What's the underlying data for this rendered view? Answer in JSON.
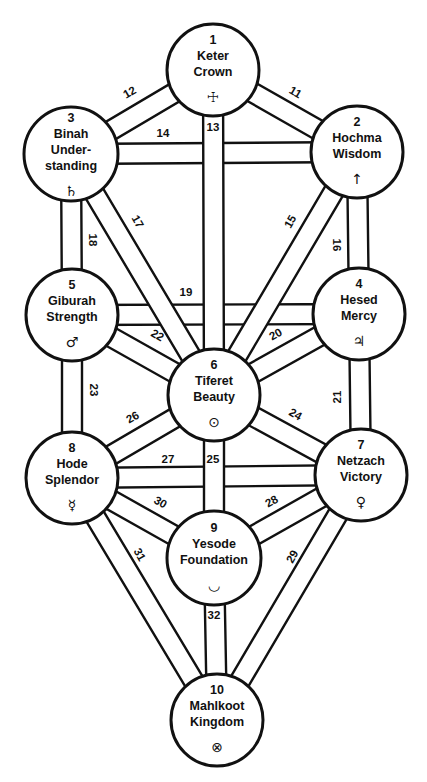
{
  "nodes": [
    {
      "id": 1,
      "num": "1",
      "lines": [
        "Keter",
        "Crown"
      ],
      "symbol": "☩",
      "symbol_name": "cross-icon",
      "cx": 213,
      "cy": 70,
      "r": 46
    },
    {
      "id": 2,
      "num": "2",
      "lines": [
        "Hochma",
        "Wisdom"
      ],
      "symbol": "↑",
      "symbol_name": "arrow-up-icon",
      "cx": 357,
      "cy": 152,
      "r": 46
    },
    {
      "id": 3,
      "num": "3",
      "lines": [
        "Binah",
        "Under-",
        "standing"
      ],
      "symbol": "♄",
      "symbol_name": "saturn-icon",
      "cx": 71,
      "cy": 154,
      "r": 47
    },
    {
      "id": 4,
      "num": "4",
      "lines": [
        "Hesed",
        "Mercy"
      ],
      "symbol": "♃",
      "symbol_name": "jupiter-icon",
      "cx": 359,
      "cy": 314,
      "r": 46
    },
    {
      "id": 5,
      "num": "5",
      "lines": [
        "Giburah",
        "Strength"
      ],
      "symbol": "♂",
      "symbol_name": "mars-icon",
      "cx": 72,
      "cy": 315,
      "r": 46
    },
    {
      "id": 6,
      "num": "6",
      "lines": [
        "Tiferet",
        "Beauty"
      ],
      "symbol": "⊙",
      "symbol_name": "sun-icon",
      "cx": 214,
      "cy": 395,
      "r": 46
    },
    {
      "id": 7,
      "num": "7",
      "lines": [
        "Netzach",
        "Victory"
      ],
      "symbol": "♀",
      "symbol_name": "venus-icon",
      "cx": 361,
      "cy": 475,
      "r": 46
    },
    {
      "id": 8,
      "num": "8",
      "lines": [
        "Hode",
        "Splendor"
      ],
      "symbol": "☿",
      "symbol_name": "mercury-icon",
      "cx": 72,
      "cy": 478,
      "r": 46
    },
    {
      "id": 9,
      "num": "9",
      "lines": [
        "Yesode",
        "Foundation"
      ],
      "symbol": "◡",
      "symbol_name": "moon-icon",
      "cx": 214,
      "cy": 558,
      "r": 47
    },
    {
      "id": 10,
      "num": "10",
      "lines": [
        "Mahlkoot",
        "Kingdom"
      ],
      "symbol": "⊗",
      "symbol_name": "earth-icon",
      "cx": 217,
      "cy": 720,
      "r": 46
    }
  ],
  "paths": [
    {
      "label": "11",
      "from": 1,
      "to": 2,
      "lx": 295,
      "ly": 93,
      "rot": 30
    },
    {
      "label": "12",
      "from": 1,
      "to": 3,
      "lx": 130,
      "ly": 93,
      "rot": -30
    },
    {
      "label": "13",
      "from": 1,
      "to": 6,
      "lx": 213,
      "ly": 128,
      "rot": 0
    },
    {
      "label": "14",
      "from": 3,
      "to": 2,
      "lx": 163,
      "ly": 134,
      "rot": 0
    },
    {
      "label": "15",
      "from": 2,
      "to": 6,
      "lx": 291,
      "ly": 222,
      "rot": -60
    },
    {
      "label": "16",
      "from": 2,
      "to": 4,
      "lx": 336,
      "ly": 245,
      "rot": 90
    },
    {
      "label": "17",
      "from": 3,
      "to": 6,
      "lx": 137,
      "ly": 222,
      "rot": 60
    },
    {
      "label": "18",
      "from": 3,
      "to": 5,
      "lx": 92,
      "ly": 240,
      "rot": 90
    },
    {
      "label": "19",
      "from": 5,
      "to": 4,
      "lx": 186,
      "ly": 293,
      "rot": 0
    },
    {
      "label": "20",
      "from": 4,
      "to": 6,
      "lx": 276,
      "ly": 335,
      "rot": -30
    },
    {
      "label": "21",
      "from": 4,
      "to": 7,
      "lx": 338,
      "ly": 397,
      "rot": -90
    },
    {
      "label": "22",
      "from": 5,
      "to": 6,
      "lx": 157,
      "ly": 336,
      "rot": 30
    },
    {
      "label": "23",
      "from": 5,
      "to": 8,
      "lx": 93,
      "ly": 390,
      "rot": 90
    },
    {
      "label": "24",
      "from": 6,
      "to": 7,
      "lx": 295,
      "ly": 415,
      "rot": 30
    },
    {
      "label": "25",
      "from": 6,
      "to": 9,
      "lx": 213,
      "ly": 460,
      "rot": 0
    },
    {
      "label": "26",
      "from": 6,
      "to": 8,
      "lx": 133,
      "ly": 418,
      "rot": -30
    },
    {
      "label": "27",
      "from": 8,
      "to": 7,
      "lx": 168,
      "ly": 460,
      "rot": 0
    },
    {
      "label": "28",
      "from": 7,
      "to": 9,
      "lx": 272,
      "ly": 502,
      "rot": -30
    },
    {
      "label": "29",
      "from": 7,
      "to": 10,
      "lx": 293,
      "ly": 557,
      "rot": -60
    },
    {
      "label": "30",
      "from": 8,
      "to": 9,
      "lx": 160,
      "ly": 503,
      "rot": 30
    },
    {
      "label": "31",
      "from": 8,
      "to": 10,
      "lx": 139,
      "ly": 555,
      "rot": 60
    },
    {
      "label": "32",
      "from": 9,
      "to": 10,
      "lx": 214,
      "ly": 616,
      "rot": 0
    }
  ],
  "style": {
    "ink": "#111111",
    "paper": "#ffffff",
    "band_width": 20
  }
}
